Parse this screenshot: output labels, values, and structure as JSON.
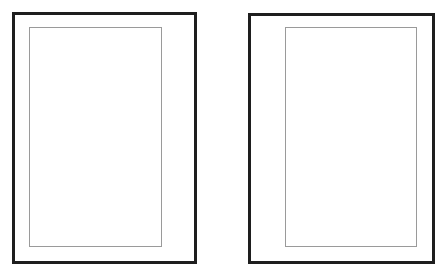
{
  "canvas": {
    "width": 445,
    "height": 275,
    "background": "#ffffff"
  },
  "colors": {
    "outer_border": "#1e1e1e",
    "inner_border": "#9a9a9a"
  },
  "panels": [
    {
      "id": "left",
      "content": ""
    },
    {
      "id": "right",
      "content": ""
    }
  ]
}
